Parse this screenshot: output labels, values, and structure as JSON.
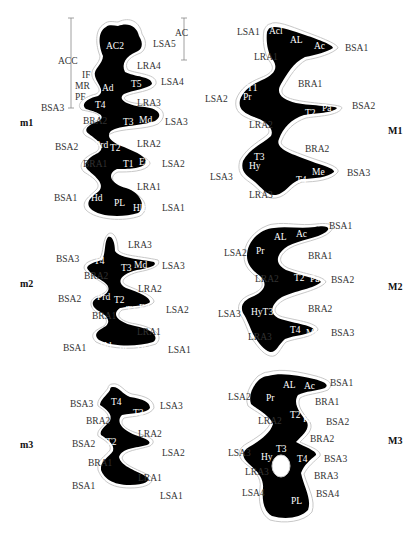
{
  "figure": {
    "teeth": [
      {
        "id": "m1",
        "label": "m1",
        "brackets": [
          {
            "label": "ACC"
          },
          {
            "label": "AC"
          }
        ],
        "interior_labels": [
          "AC2",
          "Ad",
          "T5",
          "T4",
          "T3",
          "Md",
          "Prd",
          "T2",
          "T1",
          "Ed",
          "Hd",
          "PL",
          "Hld"
        ],
        "left_labels": [
          "IF",
          "MR",
          "PF",
          "BSA3",
          "BRA2",
          "BSA2",
          "BRA1",
          "BSA1"
        ],
        "right_labels": [
          "LSA5",
          "LRA4",
          "LSA4",
          "LRA3",
          "LSA3",
          "LRA2",
          "LSA2",
          "LRA1",
          "LSA1"
        ]
      },
      {
        "id": "m2",
        "label": "m2",
        "interior_labels": [
          "T4",
          "T3",
          "Md",
          "Prd",
          "T2",
          "T1",
          "Ed",
          "Hd",
          "PL",
          "Hld"
        ],
        "left_labels": [
          "BSA3",
          "BRA2",
          "BSA2",
          "BRA1",
          "BSA1"
        ],
        "right_labels": [
          "LRA3",
          "LSA3",
          "LRA2",
          "LSA2",
          "LRA1",
          "LSA1"
        ]
      },
      {
        "id": "m3",
        "label": "m3",
        "interior_labels": [
          "T4",
          "T3",
          "T2",
          "T1",
          "PL"
        ],
        "left_labels": [
          "BSA3",
          "BRA2",
          "BSA2",
          "BRA1",
          "BSA1"
        ],
        "right_labels": [
          "LSA3",
          "LRA2",
          "LSA2",
          "LRA1",
          "LSA1"
        ]
      },
      {
        "id": "M1",
        "label": "M1",
        "interior_labels": [
          "Acl",
          "AL",
          "Ac",
          "T1",
          "Pr",
          "T2",
          "Pa",
          "T3",
          "Hy",
          "T4",
          "Me"
        ],
        "left_labels": [
          "LSA1",
          "LRA1",
          "LSA2",
          "LRA2",
          "LSA3",
          "LRA3"
        ],
        "right_labels": [
          "BSA1",
          "BRA1",
          "BSA2",
          "BRA2",
          "BSA3"
        ]
      },
      {
        "id": "M2",
        "label": "M2",
        "interior_labels": [
          "AL",
          "Ac",
          "Pr",
          "T2",
          "Pa",
          "HyT3",
          "T4",
          "Me"
        ],
        "left_labels": [
          "LSA2",
          "LRA2",
          "LSA3",
          "LRA3"
        ],
        "right_labels": [
          "BSA1",
          "BRA1",
          "BSA2",
          "BRA2",
          "BSA3"
        ]
      },
      {
        "id": "M3",
        "label": "M3",
        "interior_labels": [
          "AL",
          "Ac",
          "Pr",
          "T2",
          "Pa",
          "Hy",
          "T3",
          "T4",
          "PL"
        ],
        "left_labels": [
          "LSA2",
          "LRA2",
          "LSA3",
          "LRA3",
          "LSA4"
        ],
        "right_labels": [
          "BSA1",
          "BRA1",
          "BSA2",
          "BRA2",
          "BSA3",
          "BRA3",
          "BSA4"
        ]
      }
    ]
  },
  "m1": {
    "label": "m1",
    "ACC": "ACC",
    "AC": "AC",
    "AC2": "AC2",
    "LSA5": "LSA5",
    "LRA4": "LRA4",
    "IF": "IF",
    "MR": "MR",
    "PF": "PF",
    "Ad": "Ad",
    "T5": "T5",
    "LSA4": "LSA4",
    "BSA3": "BSA3",
    "T4": "T4",
    "LRA3": "LRA3",
    "BRA2": "BRA2",
    "T3": "T3",
    "Md": "Md",
    "LSA3": "LSA3",
    "BSA2": "BSA2",
    "Prd": "Prd",
    "T2": "T2",
    "LRA2": "LRA2",
    "BRA1": "BRA1",
    "T1": "T1",
    "Ed": "Ed",
    "LSA2": "LSA2",
    "LRA1": "LRA1",
    "BSA1": "BSA1",
    "Hd": "Hd",
    "PL": "PL",
    "Hld": "Hld",
    "LSA1": "LSA1"
  },
  "m2": {
    "label": "m2",
    "LRA3": "LRA3",
    "BSA3": "BSA3",
    "T4": "T4",
    "T3": "T3",
    "Md": "Md",
    "LSA3": "LSA3",
    "BRA2": "BRA2",
    "LRA2": "LRA2",
    "BSA2": "BSA2",
    "Prd": "Prd",
    "T2": "T2",
    "T1": "T1",
    "Ed": "Ed",
    "LSA2": "LSA2",
    "BRA1": "BRA1",
    "LRA1": "LRA1",
    "BSA1": "BSA1",
    "Hd": "Hd",
    "PL": "PL",
    "Hld": "Hld",
    "LSA1": "LSA1"
  },
  "m3": {
    "label": "m3",
    "BSA3": "BSA3",
    "T4": "T4",
    "T3": "T3",
    "LSA3": "LSA3",
    "BRA2": "BRA2",
    "LRA2": "LRA2",
    "BSA2": "BSA2",
    "T2": "T2",
    "T1": "T1",
    "LSA2": "LSA2",
    "BRA1": "BRA1",
    "LRA1": "LRA1",
    "BSA1": "BSA1",
    "PL": "PL",
    "LSA1": "LSA1"
  },
  "M1": {
    "label": "M1",
    "LSA1": "LSA1",
    "Acl": "Acl",
    "AL": "AL",
    "Ac": "Ac",
    "BSA1": "BSA1",
    "LRA1": "LRA1",
    "BRA1": "BRA1",
    "LSA2": "LSA2",
    "T1": "T1",
    "Pr": "Pr",
    "T2": "T2",
    "Pa": "Pa",
    "BSA2": "BSA2",
    "LRA2": "LRA2",
    "BRA2": "BRA2",
    "LSA3": "LSA3",
    "T3": "T3",
    "Hy": "Hy",
    "T4": "T4",
    "Me": "Me",
    "BSA3": "BSA3",
    "LRA3": "LRA3"
  },
  "M2": {
    "label": "M2",
    "BSA1": "BSA1",
    "AL": "AL",
    "Ac": "Ac",
    "LSA2": "LSA2",
    "Pr": "Pr",
    "BRA1": "BRA1",
    "LRA2": "LRA2",
    "T2": "T2",
    "Pa": "Pa",
    "BSA2": "BSA2",
    "LSA3": "LSA3",
    "HyT3": "HyT3",
    "BRA2": "BRA2",
    "LRA3": "LRA3",
    "T4": "T4",
    "Me": "Me",
    "BSA3": "BSA3"
  },
  "M3": {
    "label": "M3",
    "BSA1": "BSA1",
    "AL": "AL",
    "Ac": "Ac",
    "LSA2": "LSA2",
    "Pr": "Pr",
    "BRA1": "BRA1",
    "LRA2": "LRA2",
    "T2": "T2",
    "Pa": "Pa",
    "BSA2": "BSA2",
    "BRA2": "BRA2",
    "LSA3": "LSA3",
    "Hy": "Hy",
    "T3": "T3",
    "T4": "T4",
    "BSA3": "BSA3",
    "LRA3": "LRA3",
    "BRA3": "BRA3",
    "LSA4": "LSA4",
    "BSA4": "BSA4",
    "PL": "PL"
  }
}
